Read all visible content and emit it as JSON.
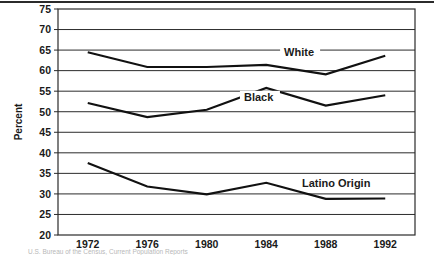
{
  "figure": {
    "top_rule_color": "#2b2b2b",
    "background_color": "#ffffff",
    "line_color": "#111111",
    "axis_color": "#2b2b2b"
  },
  "chart_data": {
    "type": "line",
    "title": "",
    "subtitle": "",
    "xlabel": "",
    "ylabel": "Percent",
    "x": [
      1972,
      1976,
      1980,
      1984,
      1988,
      1992
    ],
    "categories": [
      "1972",
      "1976",
      "1980",
      "1984",
      "1988",
      "1992"
    ],
    "xlim": [
      1970,
      1994
    ],
    "ylim": [
      20,
      75
    ],
    "ytick_values": [
      20,
      25,
      30,
      35,
      40,
      45,
      50,
      55,
      60,
      65,
      70,
      75
    ],
    "ytick_labels": [
      "20",
      "25",
      "30",
      "35",
      "40",
      "45",
      "50",
      "55",
      "60",
      "65",
      "70",
      "75"
    ],
    "xtick_labels": [
      "1972",
      "1976",
      "1980",
      "1984",
      "1988",
      "1992"
    ],
    "grid": true,
    "grid_axis": "y",
    "legend_position": "inline-annotations",
    "series": [
      {
        "name": "White",
        "values": [
          64.5,
          60.9,
          60.9,
          61.4,
          59.1,
          63.6
        ],
        "label": "White"
      },
      {
        "name": "Black",
        "values": [
          52.1,
          48.7,
          50.5,
          55.8,
          51.5,
          54.0
        ],
        "label": "Black"
      },
      {
        "name": "Latino Origin",
        "values": [
          37.5,
          31.8,
          29.9,
          32.7,
          28.8,
          28.9
        ],
        "label": "Latino Origin"
      }
    ],
    "annotations": [
      {
        "text": "White",
        "x": 1985.2,
        "y": 63.9
      },
      {
        "text": "Black",
        "x": 1982.5,
        "y": 52.9
      },
      {
        "text": "Latino Origin",
        "x": 1986.4,
        "y": 32.0
      }
    ]
  },
  "caption": {
    "text": "U.S. Bureau of the Census, Current Population Reports"
  }
}
